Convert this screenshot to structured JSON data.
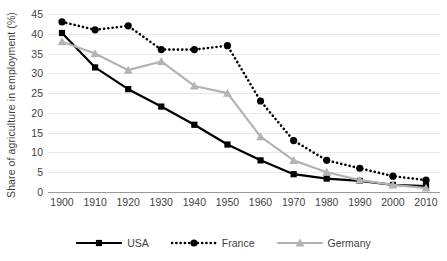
{
  "chart_data": {
    "type": "line",
    "title": "",
    "xlabel": "",
    "ylabel": "Share of agriculture in employment (%)",
    "x": [
      1900,
      1910,
      1920,
      1930,
      1940,
      1950,
      1960,
      1970,
      1980,
      1990,
      2000,
      2010
    ],
    "xtick_labels": [
      "1900",
      "1910",
      "1920",
      "1930",
      "1940",
      "1950",
      "1960",
      "1970",
      "1980",
      "1990",
      "2000",
      "2010"
    ],
    "ytick_labels": [
      "0",
      "5",
      "10",
      "15",
      "20",
      "25",
      "30",
      "35",
      "40",
      "45"
    ],
    "yticks": [
      0,
      5,
      10,
      15,
      20,
      25,
      30,
      35,
      40,
      45
    ],
    "ylim": [
      0,
      45
    ],
    "xlim": [
      1900,
      2010
    ],
    "grid": "horizontal",
    "legend_position": "bottom",
    "series": [
      {
        "name": "USA",
        "color": "#000000",
        "line_style": "solid",
        "marker": "square",
        "values": [
          40.2,
          31.5,
          26.0,
          21.6,
          17.0,
          12.0,
          8.0,
          4.5,
          3.4,
          2.8,
          1.8,
          1.5
        ]
      },
      {
        "name": "France",
        "color": "#000000",
        "line_style": "dotted",
        "marker": "circle",
        "values": [
          43.0,
          41.0,
          42.0,
          36.0,
          36.0,
          37.0,
          23.0,
          13.0,
          8.0,
          6.0,
          4.0,
          3.0
        ]
      },
      {
        "name": "Germany",
        "color": "#b3b3b3",
        "line_style": "solid",
        "marker": "triangle",
        "values": [
          38.0,
          35.0,
          30.8,
          33.0,
          26.8,
          25.0,
          14.0,
          8.0,
          5.0,
          3.0,
          1.8,
          1.0
        ]
      }
    ]
  },
  "legend": {
    "items": [
      {
        "label": "USA"
      },
      {
        "label": "France"
      },
      {
        "label": "Germany"
      }
    ]
  }
}
